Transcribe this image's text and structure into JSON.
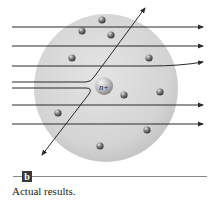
{
  "figure": {
    "panel_label": "b",
    "caption": "Actual results.",
    "nucleus_label": "n+",
    "colors": {
      "sphere": "#d6d6d6",
      "sphere_edge": "#c4c4c4",
      "nucleus": "#b8b8b8",
      "electron": "#6e6e6e",
      "ray": "#2a2a2a",
      "label_box": "#3a3a3a"
    },
    "sphere": {
      "cx": 106,
      "cy": 88,
      "r": 72
    },
    "nucleus": {
      "cx": 104,
      "cy": 86,
      "r": 9
    },
    "electrons": [
      {
        "cx": 102,
        "cy": 20
      },
      {
        "cx": 82,
        "cy": 31
      },
      {
        "cx": 111,
        "cy": 35
      },
      {
        "cx": 72,
        "cy": 58
      },
      {
        "cx": 149,
        "cy": 58
      },
      {
        "cx": 124,
        "cy": 95
      },
      {
        "cx": 160,
        "cy": 92
      },
      {
        "cx": 58,
        "cy": 113
      },
      {
        "cx": 147,
        "cy": 130
      },
      {
        "cx": 100,
        "cy": 146
      }
    ],
    "rays": [
      {
        "type": "straight",
        "y": 27
      },
      {
        "type": "straight",
        "y": 46
      },
      {
        "type": "slight-deflection",
        "y": 66
      },
      {
        "type": "deflected-up",
        "y": 82
      },
      {
        "type": "deflected-down",
        "y": 88
      },
      {
        "type": "straight",
        "y": 105
      },
      {
        "type": "straight",
        "y": 124
      }
    ]
  }
}
